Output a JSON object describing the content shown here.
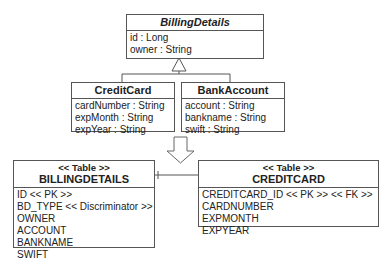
{
  "classes": {
    "billing_details": {
      "name": "BillingDetails",
      "attributes": [
        "id : Long",
        "owner : String"
      ]
    },
    "credit_card": {
      "name": "CreditCard",
      "attributes": [
        "cardNumber : String",
        "expMonth : String",
        "expYear : String"
      ]
    },
    "bank_account": {
      "name": "BankAccount",
      "attributes": [
        "account : String",
        "bankname : String",
        "swift : String"
      ]
    }
  },
  "tables": {
    "billingdetails": {
      "stereotype": "<< Table >>",
      "name": "BILLINGDETAILS",
      "columns": [
        "ID << PK >>",
        "BD_TYPE << Discriminator >>",
        "OWNER",
        "ACCOUNT",
        "BANKNAME",
        "SWIFT"
      ]
    },
    "creditcard": {
      "stereotype": "<< Table >>",
      "name": "CREDITCARD",
      "columns": [
        "CREDITCARD_ID << PK >> << FK >>",
        "CARDNUMBER",
        "EXPMONTH",
        "EXPYEAR"
      ]
    }
  },
  "colors": {
    "line": "#555555",
    "background": "#ffffff"
  }
}
